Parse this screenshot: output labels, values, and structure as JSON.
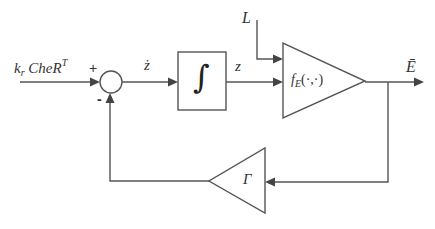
{
  "diagram": {
    "type": "feedback-block-diagram",
    "input": {
      "label_main": "k",
      "label_sub": "r",
      "label_rest": " CheR",
      "label_sup": "T"
    },
    "summing_junction": {
      "plus_sign": "+",
      "minus_sign": "-"
    },
    "signals": {
      "z_dot": "ż",
      "z": "z",
      "L": "L",
      "output": "Ē"
    },
    "blocks": {
      "integrator": {
        "symbol": "∫"
      },
      "function_block": {
        "label_main": "f",
        "label_sub": "E",
        "label_args": "(·,·)"
      },
      "feedback_gain": {
        "symbol": "Γ"
      }
    },
    "colors": {
      "line": "#555555",
      "arrow": "#444444",
      "text": "#333333",
      "background": "#ffffff"
    }
  }
}
